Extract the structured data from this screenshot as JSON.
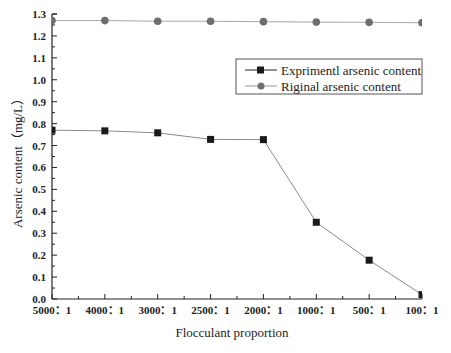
{
  "chart_data": {
    "type": "line",
    "title": "",
    "xlabel": "Flocculant proportion",
    "ylabel": "Arsenic content（mg/L）",
    "categories": [
      "5000：1",
      "4000：1",
      "3000：1",
      "2500：1",
      "2000：1",
      "1000：1",
      "500：1",
      "100：1"
    ],
    "ylim": [
      0.0,
      1.3
    ],
    "yticks": [
      0.0,
      0.1,
      0.2,
      0.3,
      0.4,
      0.5,
      0.6,
      0.7,
      0.8,
      0.9,
      1.0,
      1.1,
      1.2,
      1.3
    ],
    "ytick_labels": [
      "0.0",
      "0.1",
      "0.2",
      "0.3",
      "0.4",
      "0.5",
      "0.6",
      "0.7",
      "0.8",
      "0.9",
      "1.0",
      "1.1",
      "1.2",
      "1.3"
    ],
    "grid": false,
    "legend_position": "upper right (inside, below top series)",
    "series": [
      {
        "name": "Exprimentl arsenic content",
        "marker": "square",
        "marker_color": "#1a1a1a",
        "line_color": "#8a8a8a",
        "values": [
          0.77,
          0.767,
          0.758,
          0.728,
          0.727,
          0.35,
          0.177,
          0.02
        ]
      },
      {
        "name": "Riginal arsenic content",
        "marker": "circle",
        "marker_color": "#6e6e6e",
        "line_color": "#a8a8a8",
        "values": [
          1.27,
          1.27,
          1.267,
          1.267,
          1.265,
          1.263,
          1.262,
          1.26
        ]
      }
    ]
  },
  "legend": {
    "items": [
      {
        "label": "Exprimentl arsenic content"
      },
      {
        "label": "Riginal arsenic content"
      }
    ]
  },
  "axes": {
    "x_title": "Flocculant proportion",
    "y_title": "Arsenic content（mg/L）"
  }
}
